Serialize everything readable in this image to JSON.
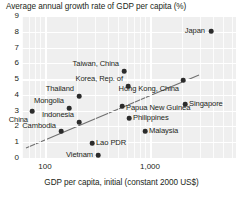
{
  "chart_data": {
    "type": "scatter",
    "title": "Average annual growth rate of GDP per capita (%)",
    "xlabel": "GDP per capita, initial (constant 2000 US$)",
    "ylabel": "Average annual growth rate of GDP per capita (%)",
    "xscale": "log",
    "x_tick_labels": [
      "100",
      "1,000"
    ],
    "x_tick_values": [
      100,
      1000
    ],
    "y_tick_labels": [
      "0",
      "1",
      "2",
      "3",
      "4",
      "5",
      "6",
      "7",
      "8",
      "9"
    ],
    "ylim": [
      0,
      9
    ],
    "grid": true,
    "legend": "none",
    "points": [
      {
        "name": "Japan",
        "x": 211,
        "y": 31,
        "label_side": "left",
        "label_dx": -6,
        "label_dy": 0
      },
      {
        "name": "Taiwan, China",
        "x": 124,
        "y": 71,
        "label_side": "left",
        "label_dx": -5,
        "label_dy": -7
      },
      {
        "name": "Korea, Rep. of",
        "x": 128,
        "y": 86,
        "label_side": "left",
        "label_dx": -5,
        "label_dy": -7
      },
      {
        "name": "Hong Kong, China",
        "x": 183,
        "y": 80,
        "label_side": "left",
        "label_dx": -4,
        "label_dy": 9
      },
      {
        "name": "Singapore",
        "x": 185,
        "y": 104,
        "label_side": "right",
        "label_dx": 4,
        "label_dy": 0
      },
      {
        "name": "Thailand",
        "x": 79,
        "y": 96,
        "label_side": "left",
        "label_dx": -5,
        "label_dy": -7
      },
      {
        "name": "Mongolia",
        "x": 69,
        "y": 108,
        "label_side": "left",
        "label_dx": -5,
        "label_dy": -7
      },
      {
        "name": "Papua New Guinea",
        "x": 122,
        "y": 106,
        "label_side": "right",
        "label_dx": 4,
        "label_dy": 2
      },
      {
        "name": "Philippines",
        "x": 129,
        "y": 118,
        "label_side": "right",
        "label_dx": 4,
        "label_dy": 0
      },
      {
        "name": "Malaysia",
        "x": 145,
        "y": 131,
        "label_side": "right",
        "label_dx": 4,
        "label_dy": 0
      },
      {
        "name": "Indonesia",
        "x": 79,
        "y": 122,
        "label_side": "left",
        "label_dx": -5,
        "label_dy": -7
      },
      {
        "name": "China",
        "x": 32,
        "y": 111,
        "label_side": "left",
        "label_dx": -4,
        "label_dy": 9
      },
      {
        "name": "Cambodia",
        "x": 61,
        "y": 131,
        "label_side": "left",
        "label_dx": -5,
        "label_dy": -5
      },
      {
        "name": "Lao PDR",
        "x": 92,
        "y": 143,
        "label_side": "right",
        "label_dx": 4,
        "label_dy": 0
      },
      {
        "name": "Vietnam",
        "x": 98,
        "y": 155,
        "label_side": "left",
        "label_dx": -5,
        "label_dy": 0
      }
    ],
    "trendline": {
      "x1": 26,
      "y1": 148,
      "x2": 199,
      "y2": 75
    },
    "colors": {
      "plot_background": "#efefef",
      "gridline": "#ffffff",
      "point": "#2b2b2b",
      "text": "#231f20",
      "trendline": "#6f6f6f"
    }
  }
}
